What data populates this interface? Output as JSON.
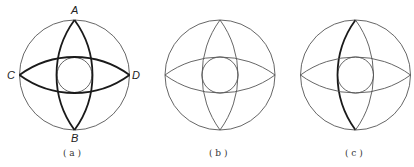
{
  "figure": {
    "panels": [
      {
        "id": "a",
        "caption": "( a )",
        "center": [
          74.5,
          75
        ],
        "outer_radius": 55,
        "inner_radius": 17.5,
        "lens_bulge": 18,
        "bold": [
          "vertical-left",
          "vertical-right",
          "horizontal-top",
          "horizontal-bottom"
        ],
        "points": {
          "A": "A",
          "B": "B",
          "C": "C",
          "D": "D"
        }
      },
      {
        "id": "b",
        "caption": "( b )",
        "center": [
          220,
          75
        ],
        "outer_radius": 55,
        "inner_radius": 18,
        "lens_bulge": 18,
        "bold": []
      },
      {
        "id": "c",
        "caption": "( c )",
        "center": [
          355.5,
          75
        ],
        "outer_radius": 55,
        "inner_radius": 18,
        "lens_bulge": 18,
        "bold": [
          "vertical-left"
        ]
      }
    ],
    "colors": {
      "thin_stroke": "#555555",
      "bold_stroke": "#1a1a1a",
      "background": "#ffffff"
    }
  }
}
